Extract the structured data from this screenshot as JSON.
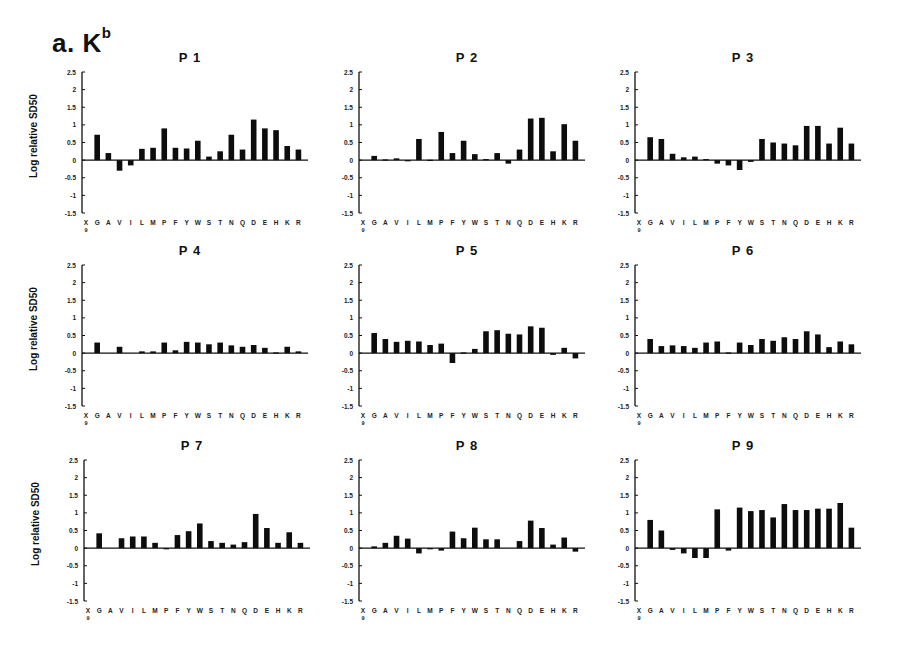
{
  "figure": {
    "label": "a. K",
    "label_superscript": "b",
    "ylabel": "Log relative SD50"
  },
  "chart_data": [
    {
      "type": "bar",
      "title": "P1",
      "xlabel": "",
      "ylabel": "Log relative SD50",
      "ylim": [
        -1.5,
        2.5
      ],
      "yticks": [
        2.5,
        2,
        1.5,
        1,
        0.5,
        0,
        -0.5,
        -1,
        -1.5
      ],
      "categories": [
        "X9",
        "G",
        "A",
        "V",
        "I",
        "L",
        "M",
        "P",
        "F",
        "Y",
        "W",
        "S",
        "T",
        "N",
        "Q",
        "D",
        "E",
        "H",
        "K",
        "R"
      ],
      "values": [
        null,
        0.72,
        0.2,
        -0.3,
        -0.15,
        0.32,
        0.35,
        0.9,
        0.35,
        0.33,
        0.55,
        0.1,
        0.25,
        0.72,
        0.3,
        1.15,
        0.9,
        0.85,
        0.4,
        0.3
      ]
    },
    {
      "type": "bar",
      "title": "P2",
      "xlabel": "",
      "ylabel": "",
      "ylim": [
        -1.5,
        2.5
      ],
      "yticks": [
        2.5,
        2,
        1.5,
        1,
        0.5,
        0,
        -0.5,
        -1,
        -1.5
      ],
      "categories": [
        "X9",
        "G",
        "A",
        "V",
        "I",
        "L",
        "M",
        "P",
        "F",
        "Y",
        "W",
        "S",
        "T",
        "N",
        "Q",
        "D",
        "E",
        "H",
        "K",
        "R"
      ],
      "values": [
        null,
        0.12,
        0.02,
        0.05,
        -0.02,
        0.6,
        0.01,
        0.8,
        0.2,
        0.55,
        0.17,
        0.03,
        0.2,
        -0.1,
        0.3,
        1.18,
        1.2,
        0.25,
        1.02,
        0.55
      ]
    },
    {
      "type": "bar",
      "title": "P3",
      "xlabel": "",
      "ylabel": "",
      "ylim": [
        -1.5,
        2.5
      ],
      "yticks": [
        2.5,
        2,
        1.5,
        1,
        0.5,
        0,
        -0.5,
        -1,
        -1.5
      ],
      "categories": [
        "X9",
        "G",
        "A",
        "V",
        "I",
        "L",
        "M",
        "P",
        "F",
        "Y",
        "W",
        "S",
        "T",
        "N",
        "Q",
        "D",
        "E",
        "H",
        "K",
        "R"
      ],
      "values": [
        null,
        0.65,
        0.6,
        0.18,
        0.08,
        0.1,
        0.03,
        -0.1,
        -0.15,
        -0.28,
        -0.05,
        0.6,
        0.5,
        0.47,
        0.42,
        0.97,
        0.97,
        0.47,
        0.92,
        0.47
      ]
    },
    {
      "type": "bar",
      "title": "P4",
      "xlabel": "",
      "ylabel": "Log relative SD50",
      "ylim": [
        -1.5,
        2.5
      ],
      "yticks": [
        2.5,
        2,
        1.5,
        1,
        0.5,
        0,
        -0.5,
        -1,
        -1.5
      ],
      "categories": [
        "X9",
        "G",
        "A",
        "V",
        "I",
        "L",
        "M",
        "P",
        "F",
        "Y",
        "W",
        "S",
        "T",
        "N",
        "Q",
        "D",
        "E",
        "H",
        "K",
        "R"
      ],
      "values": [
        null,
        0.3,
        0.0,
        0.18,
        0.0,
        0.05,
        0.05,
        0.3,
        0.08,
        0.32,
        0.3,
        0.25,
        0.3,
        0.22,
        0.18,
        0.23,
        0.15,
        0.02,
        0.18,
        0.05
      ]
    },
    {
      "type": "bar",
      "title": "P5",
      "xlabel": "",
      "ylabel": "",
      "ylim": [
        -1.5,
        2.5
      ],
      "yticks": [
        2.5,
        2,
        1.5,
        1,
        0.5,
        0,
        -0.5,
        -1,
        -1.5
      ],
      "categories": [
        "X9",
        "G",
        "A",
        "V",
        "I",
        "L",
        "M",
        "P",
        "F",
        "Y",
        "W",
        "S",
        "T",
        "N",
        "Q",
        "D",
        "E",
        "H",
        "K",
        "R"
      ],
      "values": [
        null,
        0.57,
        0.4,
        0.32,
        0.35,
        0.33,
        0.23,
        0.27,
        -0.28,
        0.02,
        0.12,
        0.62,
        0.65,
        0.55,
        0.53,
        0.76,
        0.72,
        -0.05,
        0.15,
        -0.15
      ]
    },
    {
      "type": "bar",
      "title": "P6",
      "xlabel": "",
      "ylabel": "",
      "ylim": [
        -1.5,
        2.5
      ],
      "yticks": [
        2.5,
        2,
        1.5,
        1,
        0.5,
        0,
        -0.5,
        -1,
        -1.5
      ],
      "categories": [
        "X9",
        "G",
        "A",
        "V",
        "I",
        "L",
        "M",
        "P",
        "F",
        "Y",
        "W",
        "S",
        "T",
        "N",
        "Q",
        "D",
        "E",
        "H",
        "K",
        "R"
      ],
      "values": [
        null,
        0.4,
        0.2,
        0.22,
        0.2,
        0.15,
        0.3,
        0.33,
        0.02,
        0.3,
        0.23,
        0.4,
        0.35,
        0.45,
        0.4,
        0.62,
        0.53,
        0.17,
        0.33,
        0.25
      ]
    },
    {
      "type": "bar",
      "title": "P7",
      "xlabel": "",
      "ylabel": "Log relative SD50",
      "ylim": [
        -1.5,
        2.5
      ],
      "yticks": [
        2.5,
        2,
        1.5,
        1,
        0.5,
        0,
        -0.5,
        -1,
        -1.5
      ],
      "categories": [
        "X9",
        "G",
        "A",
        "V",
        "I",
        "L",
        "M",
        "P",
        "F",
        "Y",
        "W",
        "S",
        "T",
        "N",
        "Q",
        "D",
        "E",
        "H",
        "K",
        "R"
      ],
      "values": [
        null,
        0.42,
        0.0,
        0.28,
        0.33,
        0.33,
        0.15,
        -0.03,
        0.37,
        0.48,
        0.7,
        0.2,
        0.15,
        0.1,
        0.17,
        0.97,
        0.57,
        0.15,
        0.45,
        0.15
      ]
    },
    {
      "type": "bar",
      "title": "P8",
      "xlabel": "",
      "ylabel": "",
      "ylim": [
        -1.5,
        2.5
      ],
      "yticks": [
        2.5,
        2,
        1.5,
        1,
        0.5,
        0,
        -0.5,
        -1,
        -1.5
      ],
      "categories": [
        "X9",
        "G",
        "A",
        "V",
        "I",
        "L",
        "M",
        "P",
        "F",
        "Y",
        "W",
        "S",
        "T",
        "N",
        "Q",
        "D",
        "E",
        "H",
        "K",
        "R"
      ],
      "values": [
        null,
        0.05,
        0.15,
        0.35,
        0.27,
        -0.15,
        -0.03,
        -0.07,
        0.47,
        0.28,
        0.58,
        0.25,
        0.25,
        0.0,
        0.2,
        0.78,
        0.57,
        0.1,
        0.3,
        -0.1
      ]
    },
    {
      "type": "bar",
      "title": "P9",
      "xlabel": "",
      "ylabel": "",
      "ylim": [
        -1.5,
        2.5
      ],
      "yticks": [
        2.5,
        2,
        1.5,
        1,
        0.5,
        0,
        -0.5,
        -1,
        -1.5
      ],
      "categories": [
        "X9",
        "G",
        "A",
        "V",
        "I",
        "L",
        "M",
        "P",
        "F",
        "Y",
        "W",
        "S",
        "T",
        "N",
        "Q",
        "D",
        "E",
        "H",
        "K",
        "R"
      ],
      "values": [
        null,
        0.8,
        0.5,
        -0.05,
        -0.15,
        -0.28,
        -0.28,
        1.1,
        -0.07,
        1.15,
        1.05,
        1.08,
        0.87,
        1.25,
        1.08,
        1.08,
        1.12,
        1.12,
        1.28,
        0.58
      ]
    }
  ],
  "layout": {
    "panels": [
      {
        "left": 20,
        "top": 50
      },
      {
        "left": 297,
        "top": 50
      },
      {
        "left": 573,
        "top": 50
      },
      {
        "left": 20,
        "top": 243
      },
      {
        "left": 297,
        "top": 243
      },
      {
        "left": 573,
        "top": 243
      },
      {
        "left": 22,
        "top": 438
      },
      {
        "left": 297,
        "top": 438
      },
      {
        "left": 573,
        "top": 438
      }
    ]
  }
}
